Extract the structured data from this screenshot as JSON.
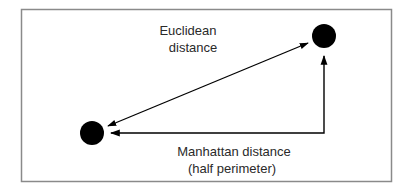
{
  "diagram": {
    "labels": {
      "euclidean_line1": "Euclidean",
      "euclidean_line2": "distance",
      "manhattan_line1": "Manhattan distance",
      "manhattan_line2": "(half perimeter)"
    },
    "nodes": [
      {
        "id": "point-a",
        "description": "lower-left point"
      },
      {
        "id": "point-b",
        "description": "upper-right point"
      }
    ],
    "edges": [
      {
        "id": "euclidean",
        "from": "point-a",
        "to": "point-b",
        "style": "double-arrow diagonal"
      },
      {
        "id": "manhattan",
        "from": "point-b",
        "to": "point-a",
        "style": "right-angle path, arrows at both ends"
      }
    ],
    "colors": {
      "frame": "#8a8a8a",
      "ink": "#000000",
      "text": "#2a2a2a"
    }
  }
}
